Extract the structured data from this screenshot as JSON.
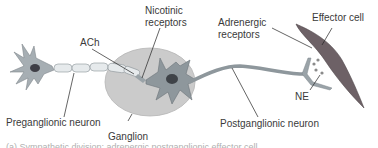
{
  "diagram": {
    "labels": {
      "nicotinic_line1": "Nicotinic",
      "nicotinic_line2": "receptors",
      "ach": "ACh",
      "adrenergic_line1": "Adrenergic",
      "adrenergic_line2": "receptors",
      "effector_cell": "Effector cell",
      "ne": "NE",
      "preganglionic": "Preganglionic neuron",
      "ganglion": "Ganglion",
      "postganglionic": "Postganglionic neuron"
    },
    "caption": "(a) Sympathetic division: adrenergic postganglionic effector cell",
    "colors": {
      "neuron_fill": "#9aa3a8",
      "neuron_dark": "#4a4f54",
      "ganglion_fill": "#c8c8c8",
      "myelin_fill": "#e4e8ea",
      "effector_fill": "#6e6266",
      "label_text": "#3a3a3a",
      "leader_line": "#222222"
    }
  }
}
